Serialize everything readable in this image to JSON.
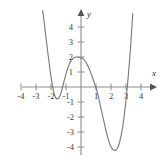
{
  "chart_data": {
    "type": "line",
    "title": "",
    "subtitle": "",
    "xlabel": "x",
    "ylabel": "y",
    "xlim": [
      -4.9,
      5.0
    ],
    "ylim": [
      -5.0,
      5.1
    ],
    "grid": false,
    "legend": "none",
    "x_ticks": [
      -4,
      -3,
      -2,
      -1,
      1,
      2,
      3,
      4
    ],
    "y_ticks": [
      4,
      3,
      2,
      1,
      -1,
      -2,
      -3,
      -4
    ],
    "x_tick_labels": [
      "-4",
      "-3",
      "-2",
      "-1",
      "1",
      "2",
      "3",
      "4"
    ],
    "y_tick_labels": [
      "4",
      "3",
      "2",
      "1",
      "-1",
      "-2",
      "-3",
      "-4"
    ],
    "annotations": [],
    "series": [
      {
        "name": "polynomial-curve",
        "color": "#7c7c7c",
        "x": [
          -2.55,
          -2.45,
          -2.35,
          -2.25,
          -2.15,
          -2.05,
          -1.95,
          -1.85,
          -1.75,
          -1.65,
          -1.55,
          -1.45,
          -1.35,
          -1.25,
          -1.15,
          -1.05,
          -0.95,
          -0.85,
          -0.75,
          -0.65,
          -0.55,
          -0.45,
          -0.35,
          -0.25,
          -0.15,
          -0.05,
          0.05,
          0.15,
          0.25,
          0.35,
          0.45,
          0.55,
          0.65,
          0.75,
          0.85,
          0.95,
          1.05,
          1.15,
          1.25,
          1.35,
          1.45,
          1.55,
          1.65,
          1.75,
          1.85,
          1.95,
          2.05,
          2.15,
          2.25,
          2.35,
          2.45,
          2.55,
          2.65,
          2.75,
          2.85,
          2.95,
          3.05,
          3.15,
          3.25,
          3.35,
          3.45
        ],
        "y": [
          5.1,
          4.3,
          3.4,
          2.6,
          1.8,
          1.0,
          0.35,
          -0.2,
          -0.6,
          -0.78,
          -0.8,
          -0.7,
          -0.45,
          -0.1,
          0.3,
          0.7,
          1.05,
          1.35,
          1.6,
          1.78,
          1.9,
          1.97,
          2.0,
          2.0,
          1.98,
          1.95,
          1.93,
          1.88,
          1.78,
          1.62,
          1.42,
          1.2,
          0.95,
          0.68,
          0.38,
          0.1,
          -0.2,
          -0.62,
          -1.05,
          -1.5,
          -1.95,
          -2.4,
          -2.85,
          -3.25,
          -3.6,
          -3.88,
          -4.08,
          -4.2,
          -4.24,
          -4.2,
          -4.05,
          -3.78,
          -3.38,
          -2.85,
          -2.18,
          -1.35,
          -0.4,
          0.7,
          1.9,
          3.3,
          4.9
        ]
      }
    ],
    "features": {
      "y_intercept": 2.0,
      "local_max": {
        "x": 0.1,
        "y": 2.0
      },
      "shallow_local_min": {
        "x": -1.55,
        "y": -0.8
      },
      "deep_local_min": {
        "x": 2.25,
        "y": -4.24
      },
      "x_intercepts": [
        -2.0,
        -1.2,
        1.0,
        3.1
      ]
    }
  },
  "axes": {
    "x_axis_name": "x",
    "y_axis_name": "y"
  }
}
